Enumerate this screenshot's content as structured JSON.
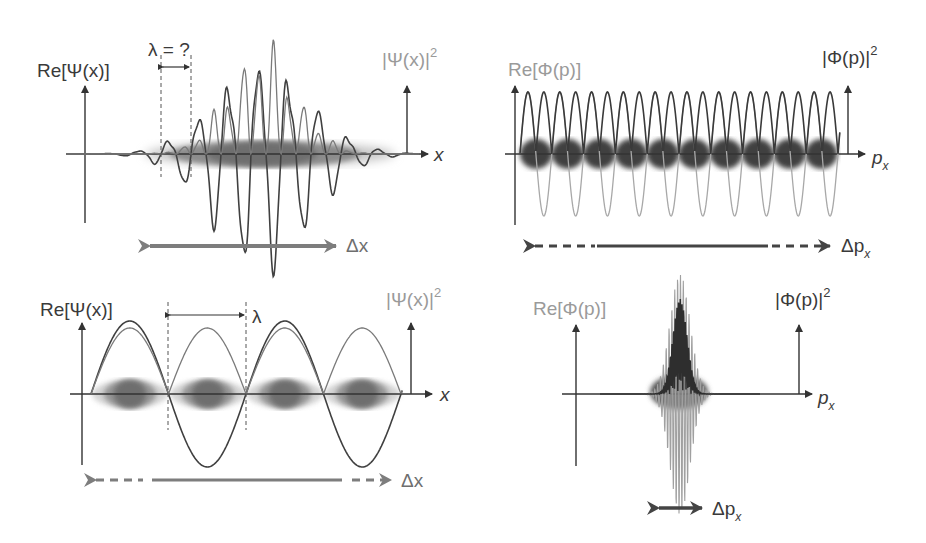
{
  "colors": {
    "dark_curve": "#404040",
    "light_curve": "#9a9a9a",
    "density_blob": "#555555",
    "arrow_gray": "#808080",
    "background": "#ffffff"
  },
  "panels": {
    "top_left": {
      "label_re": "Re[Ψ(x)]",
      "label_abs": "|Ψ(x)|",
      "label_abs_power": "2",
      "axis_label": "x",
      "wavelength_label": "λ = ?",
      "spread_label": "Δx",
      "description": "Localized wave packet in position space"
    },
    "top_right": {
      "label_re": "Re[Φ(p)]",
      "label_abs": "|Φ(p)|",
      "label_abs_power": "2",
      "axis_label": "p",
      "axis_subscript": "x",
      "spread_label": "Δp",
      "spread_subscript": "x",
      "description": "Broad spread in momentum space"
    },
    "bottom_left": {
      "label_re": "Re[Ψ(x)]",
      "label_abs": "|Ψ(x)|",
      "label_abs_power": "2",
      "axis_label": "x",
      "wavelength_label": "λ",
      "spread_label": "Δx",
      "description": "Plane-wave-like state with definite wavelength"
    },
    "bottom_right": {
      "label_re": "Re[Φ(p)]",
      "label_abs": "|Φ(p)|",
      "label_abs_power": "2",
      "axis_label": "p",
      "axis_subscript": "x",
      "spread_label": "Δp",
      "spread_subscript": "x",
      "description": "Narrow peak in momentum space"
    }
  }
}
